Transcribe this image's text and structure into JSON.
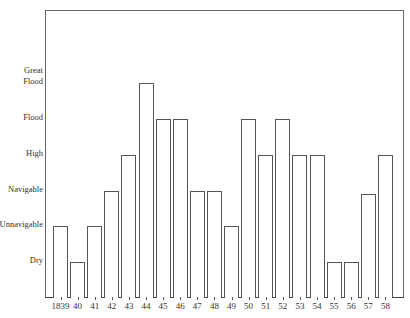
{
  "chart_data": {
    "type": "bar",
    "title": "",
    "xlabel": "",
    "ylabel": "",
    "categories": [
      "1839",
      "40",
      "41",
      "42",
      "43",
      "44",
      "45",
      "46",
      "47",
      "48",
      "49",
      "50",
      "51",
      "52",
      "53",
      "54",
      "55",
      "56",
      "57",
      "58"
    ],
    "level_names": [
      "Dry",
      "Unnavigable",
      "Navigable",
      "High",
      "Flood",
      "Great Flood"
    ],
    "values": [
      2,
      1,
      2,
      3,
      4,
      6,
      5,
      5,
      3,
      3,
      2,
      5,
      4,
      5,
      4,
      4,
      1,
      1,
      2.9,
      4
    ],
    "value_labels": [
      "Unnavigable",
      "Dry",
      "Unnavigable",
      "Navigable",
      "High",
      "Great Flood",
      "Flood",
      "Flood",
      "Navigable",
      "Navigable",
      "Unnavigable",
      "Flood",
      "High",
      "Flood",
      "High",
      "High",
      "Dry",
      "Dry",
      "Navigable",
      "High"
    ],
    "yticks": [
      {
        "value": 1,
        "label": "Dry"
      },
      {
        "value": 2,
        "label": "Unnavigable"
      },
      {
        "value": 3,
        "label": "Navigable"
      },
      {
        "value": 4,
        "label": "High"
      },
      {
        "value": 5,
        "label": "Flood"
      },
      {
        "value": 6,
        "label": "Great\nFlood"
      }
    ],
    "ylim": [
      0,
      8
    ],
    "grid": false,
    "legend": null
  }
}
